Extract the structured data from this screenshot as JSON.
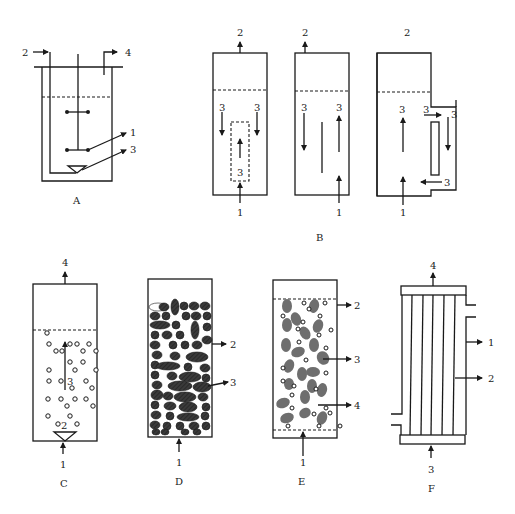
{
  "figure": {
    "panels": [
      {
        "id": "A",
        "caption": "A",
        "description": "Stirred tank bioreactor",
        "labels": {
          "1": "1",
          "2": "2",
          "3": "3",
          "4": "4"
        }
      },
      {
        "id": "B",
        "caption": "B",
        "description": "Airlift reactors (internal draft tube, split cylinder, external loop)",
        "labels": {
          "1": "1",
          "2": "2",
          "3": "3"
        }
      },
      {
        "id": "C",
        "caption": "C",
        "description": "Bubble column",
        "labels": {
          "1": "1",
          "2": "2",
          "3": "3",
          "4": "4"
        }
      },
      {
        "id": "D",
        "caption": "D",
        "description": "Packed bed reactor",
        "labels": {
          "1": "1",
          "2": "2",
          "3": "3"
        }
      },
      {
        "id": "E",
        "caption": "E",
        "description": "Fluidized bed reactor",
        "labels": {
          "1": "1",
          "2": "2",
          "3": "3",
          "4": "4"
        }
      },
      {
        "id": "F",
        "caption": "F",
        "description": "Hollow fiber membrane reactor",
        "labels": {
          "1": "1",
          "2": "2",
          "3": "3",
          "4": "4"
        }
      }
    ]
  },
  "colors": {
    "line": "#1a1a1a",
    "particle_dark": "#3a3a3a",
    "particle_gray": "#6e6e6e",
    "background": "#ffffff"
  }
}
